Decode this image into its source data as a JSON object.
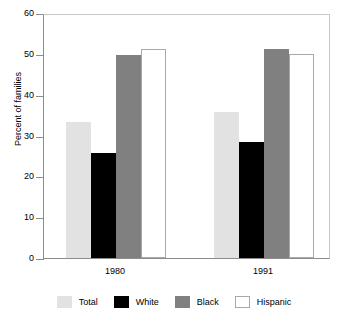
{
  "chart_data": {
    "type": "bar",
    "title": "",
    "xlabel": "",
    "ylabel": "Percent of families",
    "categories": [
      "1980",
      "1991"
    ],
    "series": [
      {
        "name": "Total",
        "color": "#e2e2e2",
        "values": [
          33.3,
          35.8
        ]
      },
      {
        "name": "White",
        "color": "#000000",
        "values": [
          25.7,
          28.4
        ]
      },
      {
        "name": "Black",
        "color": "#808080",
        "values": [
          49.7,
          51.2
        ]
      },
      {
        "name": "Hispanic",
        "color": "#ffffff",
        "values": [
          51.2,
          50.0
        ]
      }
    ],
    "ylim": [
      0,
      60
    ],
    "yticks": [
      0,
      10,
      20,
      30,
      40,
      50,
      60
    ],
    "ytick_labels": [
      "0",
      "10",
      "20",
      "30",
      "40",
      "50",
      "60"
    ],
    "grid": false,
    "legend_position": "bottom"
  },
  "axis": {
    "y_title": "Percent of families"
  },
  "legend": {
    "items": [
      {
        "label": "Total"
      },
      {
        "label": "White"
      },
      {
        "label": "Black"
      },
      {
        "label": "Hispanic"
      }
    ]
  },
  "title_sliver": ""
}
